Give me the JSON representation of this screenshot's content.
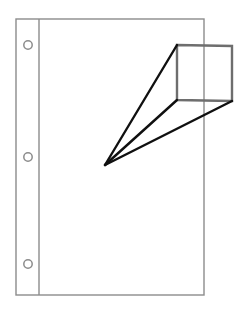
{
  "document": {
    "title": "Perspective projection of a quadrilateral frame onto a punched page",
    "background_color": "#ffffff",
    "width": 246,
    "height": 313
  },
  "figure": {
    "type": "line-drawing"
  },
  "page_sheet": {
    "name": "punched-paper-sheet",
    "stroke_color": "#8c8c8c",
    "stroke_width": 1.4,
    "fill": "none",
    "rect": {
      "x": 16,
      "y": 19,
      "width": 188,
      "height": 276
    },
    "margin_rule": {
      "name": "left-margin-rule",
      "x": 39,
      "y1": 19,
      "y2": 295
    },
    "holes": [
      {
        "label": "top-hole",
        "cx": 28,
        "cy": 45,
        "r": 4.2
      },
      {
        "label": "middle-hole",
        "cx": 28,
        "cy": 157,
        "r": 4.2
      },
      {
        "label": "bottom-hole",
        "cx": 28,
        "cy": 264,
        "r": 4.2
      }
    ],
    "hole_count": 3
  },
  "frame_quad": {
    "name": "image-plane-quadrilateral",
    "stroke_color": "#6e6e6e",
    "stroke_width": 2.4,
    "fill": "none",
    "closed": true,
    "points": [
      {
        "label": "top-left",
        "x": 177,
        "y": 45
      },
      {
        "label": "top-right",
        "x": 232,
        "y": 46
      },
      {
        "label": "bottom-right",
        "x": 232,
        "y": 101
      },
      {
        "label": "bottom-left",
        "x": 177,
        "y": 100
      }
    ]
  },
  "projection": {
    "name": "sight-lines",
    "stroke_color": "#101010",
    "stroke_width": 2.4,
    "apex": {
      "label": "eye-point",
      "x": 105,
      "y": 165
    },
    "rays": [
      {
        "label": "ray-to-top-left",
        "x2": 177,
        "y2": 45
      },
      {
        "label": "ray-to-bottom-left",
        "x2": 177,
        "y2": 100
      },
      {
        "label": "ray-to-bottom-right",
        "x2": 232,
        "y2": 101
      }
    ],
    "ray_count": 3
  },
  "captions": []
}
